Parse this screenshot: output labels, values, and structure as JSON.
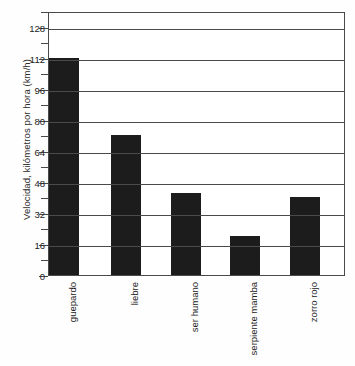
{
  "chart_data": {
    "type": "bar",
    "title": "",
    "xlabel": "",
    "ylabel": "Velocidad, kilómetros por hora (km/h)",
    "categories": [
      "guepardo",
      "liebre",
      "ser humano",
      "serpiente mamba",
      "zorro rojo"
    ],
    "values": [
      112,
      72,
      42,
      20,
      40
    ],
    "ylim": [
      0,
      136
    ],
    "major_ticks": [
      0,
      16,
      32,
      48,
      64,
      80,
      96,
      112,
      128
    ],
    "minor_ticks": [
      8,
      24,
      40,
      56,
      72,
      88,
      104,
      120,
      136
    ],
    "tick_labels": [
      "0",
      "16",
      "32",
      "48",
      "64",
      "80",
      "96",
      "112",
      "128"
    ],
    "grid": true,
    "grid_axis": "y",
    "legend": null,
    "legend_position": "none",
    "bar_color": "#1c1c1c",
    "axis_color": "#4a4a4a",
    "background": "#fefefe"
  }
}
